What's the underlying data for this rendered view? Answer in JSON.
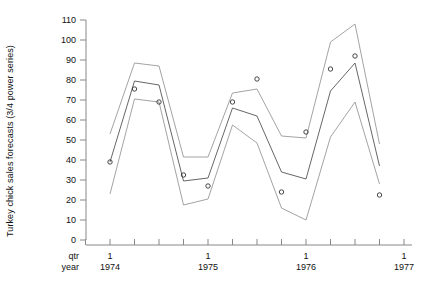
{
  "chart_data": {
    "type": "line",
    "title": "",
    "xlabel": "",
    "ylabel": "Turkey chick sales forecasts (3/4 power series)",
    "ylim": [
      0,
      110
    ],
    "yticks": [
      0,
      10,
      20,
      30,
      40,
      50,
      60,
      70,
      80,
      90,
      100,
      110
    ],
    "grid": false,
    "legend": "none",
    "corner_labels": [
      "qtr",
      "year"
    ],
    "x_major_labels": [
      {
        "qtr": "1",
        "year": "1974",
        "index": 0
      },
      {
        "qtr": "1",
        "year": "1975",
        "index": 4
      },
      {
        "qtr": "1",
        "year": "1976",
        "index": 8
      },
      {
        "qtr": "1",
        "year": "1977",
        "index": 12
      }
    ],
    "x_index_range": [
      -1,
      13
    ],
    "x_tick_indices": [
      -1,
      0,
      1,
      2,
      3,
      4,
      5,
      6,
      7,
      8,
      9,
      10,
      11,
      12,
      13
    ],
    "series": [
      {
        "name": "upper forecast bound",
        "style": "line",
        "color": "#999999",
        "x": [
          0,
          1,
          2,
          3,
          4,
          5,
          6,
          7,
          8,
          9,
          10,
          11
        ],
        "values": [
          53.0,
          88.5,
          87.0,
          41.5,
          41.5,
          73.5,
          75.5,
          52.0,
          51.0,
          99.0,
          108.0,
          48.0
        ]
      },
      {
        "name": "central forecast",
        "style": "line",
        "color": "#555555",
        "x": [
          0,
          1,
          2,
          3,
          4,
          5,
          6,
          7,
          8,
          9,
          10,
          11
        ],
        "values": [
          39.0,
          79.5,
          77.5,
          29.5,
          31.0,
          66.0,
          62.0,
          34.0,
          30.5,
          74.5,
          88.5,
          37.0
        ]
      },
      {
        "name": "lower forecast bound",
        "style": "line",
        "color": "#999999",
        "x": [
          0,
          1,
          2,
          3,
          4,
          5,
          6,
          7,
          8,
          9,
          10,
          11
        ],
        "values": [
          23.0,
          70.5,
          69.0,
          17.5,
          20.5,
          57.5,
          48.5,
          16.0,
          10.0,
          51.5,
          69.0,
          28.0
        ]
      },
      {
        "name": "observed",
        "style": "markers",
        "marker": "open-circle",
        "color": "#333333",
        "x": [
          0,
          1,
          2,
          3,
          4,
          5,
          6,
          7,
          8,
          9,
          10,
          11
        ],
        "values": [
          39.0,
          75.5,
          69.0,
          32.5,
          27.0,
          69.0,
          80.5,
          24.0,
          54.0,
          85.5,
          92.0,
          22.5
        ]
      }
    ]
  },
  "axes": {
    "y_axis_name": "y-axis",
    "x_axis_name": "x-axis"
  }
}
